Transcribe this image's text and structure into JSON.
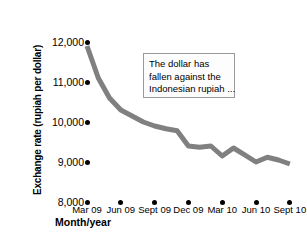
{
  "chart_data": {
    "type": "line",
    "title": "",
    "xlabel": "Month/year",
    "ylabel": "Exchange rate (rupiah per dollar)",
    "categories": [
      "Mar 09",
      "Jun 09",
      "Sept 09",
      "Dec 09",
      "Mar 10",
      "Jun 10",
      "Sept 10"
    ],
    "x_tick_labels": [
      "Mar 09",
      "Jun 09",
      "Sept 09",
      "Dec 09",
      "Mar 10",
      "Jun 10",
      "Sept 10"
    ],
    "y_tick_labels": [
      "12,000",
      "11,000",
      "10,000",
      "9,000",
      "8,000"
    ],
    "y_tick_values": [
      12000,
      11000,
      10000,
      9000,
      8000
    ],
    "ylim": [
      8000,
      12000
    ],
    "grid": false,
    "legend": false,
    "series": [
      {
        "name": "Rupiah per dollar",
        "color": "#808080",
        "points": [
          {
            "x": "Mar 09",
            "value": 11900
          },
          {
            "x": "Apr 09",
            "value": 11100
          },
          {
            "x": "May 09",
            "value": 10600
          },
          {
            "x": "Jun 09",
            "value": 10300
          },
          {
            "x": "Jul 09",
            "value": 10150
          },
          {
            "x": "Aug 09",
            "value": 10000
          },
          {
            "x": "Sept 09",
            "value": 9900
          },
          {
            "x": "Oct 09",
            "value": 9830
          },
          {
            "x": "Nov 09",
            "value": 9780
          },
          {
            "x": "Dec 09",
            "value": 9400
          },
          {
            "x": "Jan 10",
            "value": 9370
          },
          {
            "x": "Feb 10",
            "value": 9400
          },
          {
            "x": "Mar 10",
            "value": 9150
          },
          {
            "x": "Apr 10",
            "value": 9350
          },
          {
            "x": "May 10",
            "value": 9180
          },
          {
            "x": "Jun 10",
            "value": 9000
          },
          {
            "x": "Jul 10",
            "value": 9120
          },
          {
            "x": "Aug 10",
            "value": 9050
          },
          {
            "x": "Sept 10",
            "value": 8950
          }
        ]
      }
    ],
    "annotation": {
      "lines": [
        "The dollar has",
        "fallen against the",
        "Indonesian rupiah ..."
      ],
      "border_color": "#9a9a9a",
      "fill_color": "#fdfdfd"
    }
  },
  "colors": {
    "line": "#808080",
    "text": "#000000",
    "background": "#ffffff",
    "dot": "#000000"
  }
}
